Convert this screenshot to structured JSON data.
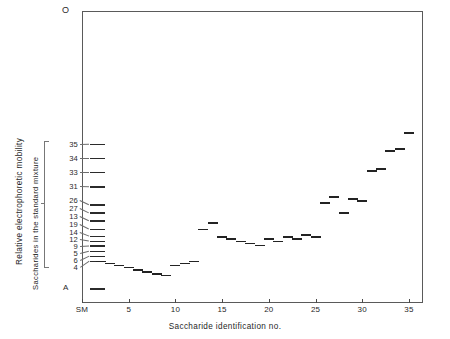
{
  "figure": {
    "origin_label": "O",
    "anode_label": "A",
    "ylabel_primary": "Relative  electrophoretic  mobility",
    "ylabel_secondary": "Saccharides in the standard mixture",
    "xlabel": "Saccharide identification no.",
    "frame_color": "#5a5a5a",
    "band_color": "#232323"
  },
  "chart_data": {
    "type": "scatter",
    "title": "",
    "subtitle": "",
    "xlabel": "Saccharide identification no.",
    "ylabel": "Relative electrophoretic mobility",
    "grid": false,
    "legend": null,
    "xlim": [
      0,
      36.5
    ],
    "ylim": [
      0,
      1
    ],
    "xtick_labels": [
      "SM",
      "5",
      "10",
      "15",
      "20",
      "25",
      "30",
      "35"
    ],
    "xtick_values": [
      0,
      5,
      10,
      15,
      20,
      25,
      30,
      35
    ],
    "ytick_labels": [
      "O",
      "A"
    ],
    "standard_mixture_lane": {
      "label": "SM",
      "x": 0,
      "band_labels": [
        "35",
        "34",
        "33",
        "31",
        "26",
        "27",
        "13",
        "19",
        "14",
        "12",
        "9",
        "5",
        "6",
        "4"
      ],
      "band_mobility": [
        0.455,
        0.503,
        0.551,
        0.6,
        0.662,
        0.69,
        0.717,
        0.745,
        0.769,
        0.786,
        0.803,
        0.821,
        0.838,
        0.855
      ]
    },
    "samples": {
      "x": [
        2,
        3,
        4,
        5,
        6,
        7,
        8,
        9,
        10,
        11,
        12,
        13,
        14,
        15,
        16,
        17,
        18,
        19,
        20,
        21,
        22,
        23,
        24,
        25,
        26,
        27,
        28,
        29,
        30,
        31,
        32,
        33,
        34,
        35
      ],
      "mobility": [
        0.855,
        0.862,
        0.869,
        0.876,
        0.883,
        0.89,
        0.897,
        0.903,
        0.869,
        0.862,
        0.855,
        0.745,
        0.724,
        0.772,
        0.779,
        0.786,
        0.793,
        0.8,
        0.779,
        0.786,
        0.772,
        0.779,
        0.765,
        0.772,
        0.655,
        0.634,
        0.69,
        0.641,
        0.648,
        0.545,
        0.538,
        0.476,
        0.469,
        0.414
      ]
    }
  }
}
